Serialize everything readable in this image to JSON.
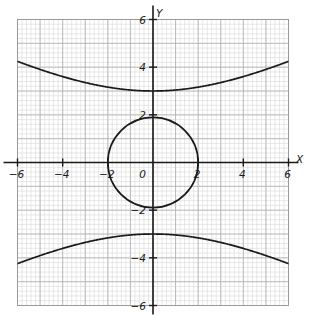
{
  "figure": {
    "title": "",
    "background_color": "#ffffff",
    "grid_color_minor": "#d9d9d9",
    "grid_color_major": "#b0b0b0",
    "axis_color": "#1a1a1a",
    "curve_color": "#1a1a1a",
    "plot_border_color": "#9a9a9a"
  },
  "axes": {
    "x_label": "X",
    "y_label": "Y",
    "x_ticks": [
      {
        "value": -6,
        "label": "−6"
      },
      {
        "value": -4,
        "label": "−4"
      },
      {
        "value": -2,
        "label": "−2"
      },
      {
        "value": 2,
        "label": "2"
      },
      {
        "value": 4,
        "label": "4"
      },
      {
        "value": 6,
        "label": "6"
      }
    ],
    "y_ticks": [
      {
        "value": 6,
        "label": "6"
      },
      {
        "value": 4,
        "label": "4"
      },
      {
        "value": 2,
        "label": "2"
      },
      {
        "value": -2,
        "label": "−2"
      },
      {
        "value": -4,
        "label": "−4"
      },
      {
        "value": -6,
        "label": "−6"
      }
    ],
    "origin_label": "0"
  },
  "chart_data": {
    "type": "line",
    "title": "",
    "xlabel": "X",
    "ylabel": "Y",
    "xlim": [
      -6,
      6
    ],
    "ylim": [
      -6,
      6
    ],
    "grid": true,
    "grid_minor_step": 0.2,
    "grid_major_step": 1,
    "legend": null,
    "series": [
      {
        "name": "circle x^2 + y^2 = 4",
        "shape": "circle",
        "center": [
          0,
          0
        ],
        "radius": 2,
        "x": [
          0,
          0.5,
          1,
          1.5,
          1.8,
          2,
          1.8,
          1.5,
          1,
          0.5,
          0,
          -0.5,
          -1,
          -1.5,
          -1.8,
          -2,
          -1.8,
          -1.5,
          -1,
          -0.5,
          0
        ],
        "values": [
          2,
          1.936,
          1.732,
          1.323,
          0.872,
          0,
          -0.872,
          -1.323,
          -1.732,
          -1.936,
          -2,
          -1.936,
          -1.732,
          -1.323,
          -0.872,
          0,
          0.872,
          1.323,
          1.732,
          1.936,
          2
        ]
      },
      {
        "name": "hyperbola upper branch y^2/9 - x^2/36 = 1",
        "shape": "hyperbola-upper",
        "a": 3,
        "b": 6,
        "x": [
          -6,
          -5,
          -4,
          -3,
          -2,
          -1,
          0,
          1,
          2,
          3,
          4,
          5,
          6
        ],
        "values": [
          4.243,
          3.905,
          3.606,
          3.354,
          3.162,
          3.041,
          3.0,
          3.041,
          3.162,
          3.354,
          3.606,
          3.905,
          4.243
        ]
      },
      {
        "name": "hyperbola lower branch y^2/9 - x^2/36 = 1",
        "shape": "hyperbola-lower",
        "a": 3,
        "b": 6,
        "x": [
          -6,
          -5,
          -4,
          -3,
          -2,
          -1,
          0,
          1,
          2,
          3,
          4,
          5,
          6
        ],
        "values": [
          -4.243,
          -3.905,
          -3.606,
          -3.354,
          -3.162,
          -3.041,
          -3.0,
          -3.041,
          -3.162,
          -3.354,
          -3.606,
          -3.905,
          -4.243
        ]
      }
    ]
  }
}
